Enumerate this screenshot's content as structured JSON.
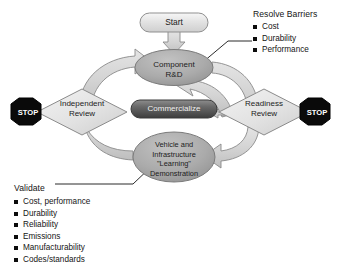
{
  "diagram": {
    "nodes": {
      "start": {
        "label": "Start",
        "shape": "rounded-rectangle"
      },
      "component_rd": {
        "line1": "Component",
        "line2": "R&D",
        "shape": "ellipse"
      },
      "commercialize": {
        "label": "Commercialize",
        "shape": "rounded-pill"
      },
      "independent_review": {
        "line1": "Independent",
        "line2": "Review",
        "shape": "diamond"
      },
      "readiness_review": {
        "line1": "Readiness",
        "line2": "Review",
        "shape": "diamond"
      },
      "vehicle_demo": {
        "line1": "Vehicle and",
        "line2": "Infrastructure",
        "line3": "\"Learning\"",
        "line4": "Demonstration",
        "shape": "ellipse"
      },
      "stop_left": {
        "label": "STOP",
        "shape": "octagon"
      },
      "stop_right": {
        "label": "STOP",
        "shape": "octagon"
      }
    },
    "callouts": {
      "resolve_barriers": {
        "title": "Resolve Barriers",
        "items": [
          "Cost",
          "Durability",
          "Performance"
        ]
      },
      "validate": {
        "title": "Validate",
        "items": [
          "Cost, performance",
          "Durability",
          "Reliability",
          "Emissions",
          "Manufacturability",
          "Codes/standards"
        ]
      }
    },
    "colors": {
      "node_fill_gray": "#a8a8a8",
      "node_fill_light": "#e8e8e8",
      "commercialize_fill": "#5f5f5f",
      "stop_fill": "#0a0a0a",
      "arrow_fill": "#d6d6d6",
      "stroke": "#6e6e6e",
      "background": "#ffffff"
    }
  }
}
